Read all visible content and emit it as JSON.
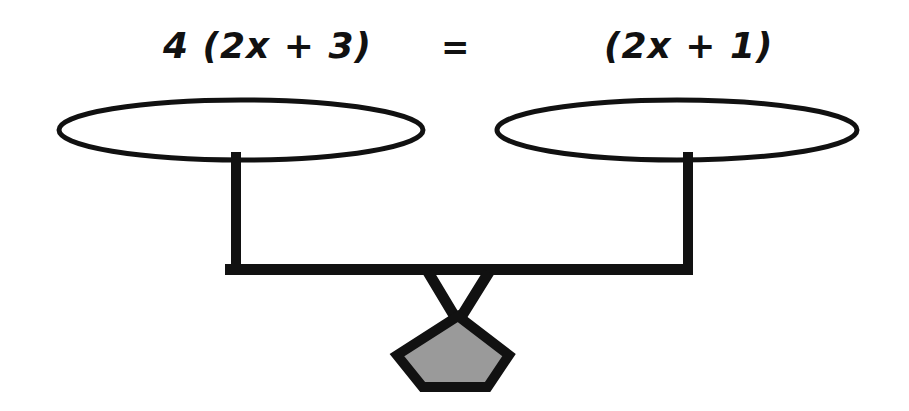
{
  "figure": {
    "background_color": "#ffffff",
    "ink_color": "#111111"
  },
  "equation": {
    "left_expression": "4 (2x + 3)",
    "operator": "=",
    "right_expression": "(2x + 1)"
  },
  "scale": {
    "left_pan": {
      "label": "left-pan",
      "shape": "ellipse",
      "center_x": 241,
      "center_y": 130,
      "radius_x": 182,
      "radius_y": 30,
      "fill": "#ffffff",
      "stroke": "#111111",
      "stroke_width": 5
    },
    "right_pan": {
      "label": "right-pan",
      "shape": "ellipse",
      "center_x": 677,
      "center_y": 130,
      "radius_x": 180,
      "radius_y": 30,
      "fill": "#ffffff",
      "stroke": "#111111",
      "stroke_width": 5
    },
    "left_post": {
      "label": "left-post",
      "x": 231,
      "y": 155,
      "width": 10,
      "height": 114,
      "fill": "#111111"
    },
    "right_post": {
      "label": "right-post",
      "x": 683,
      "y": 155,
      "width": 10,
      "height": 118,
      "fill": "#111111"
    },
    "beam": {
      "label": "beam",
      "x": 225,
      "y": 264,
      "width": 468,
      "height": 11,
      "fill": "#111111"
    },
    "fulcrum": {
      "label": "fulcrum",
      "shape": "v-bracket",
      "apex_x": 458,
      "apex_y": 322,
      "left_top_x": 428,
      "right_top_x": 489,
      "top_y": 272,
      "stroke": "#111111",
      "stroke_width": 11
    },
    "base": {
      "label": "pentagon-base",
      "shape": "pentagon",
      "center_x": 458,
      "top_y": 316,
      "bottom_y": 387,
      "left_x": 397,
      "right_x": 509,
      "fill": "#9a9a9a",
      "stroke": "#111111",
      "stroke_width": 10
    }
  }
}
